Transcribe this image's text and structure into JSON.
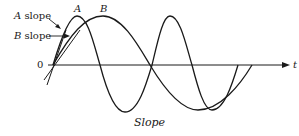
{
  "diagram": {
    "caption": "Slope",
    "axis": {
      "origin_label": "0",
      "x_label": "t"
    },
    "curves": [
      {
        "name": "A",
        "label": "A"
      },
      {
        "name": "B",
        "label": "B"
      }
    ],
    "annotations": {
      "a_slope": "A slope",
      "b_slope": "B slope"
    },
    "colors": {
      "ink": "#1a1a1a",
      "background": "#ffffff"
    }
  }
}
